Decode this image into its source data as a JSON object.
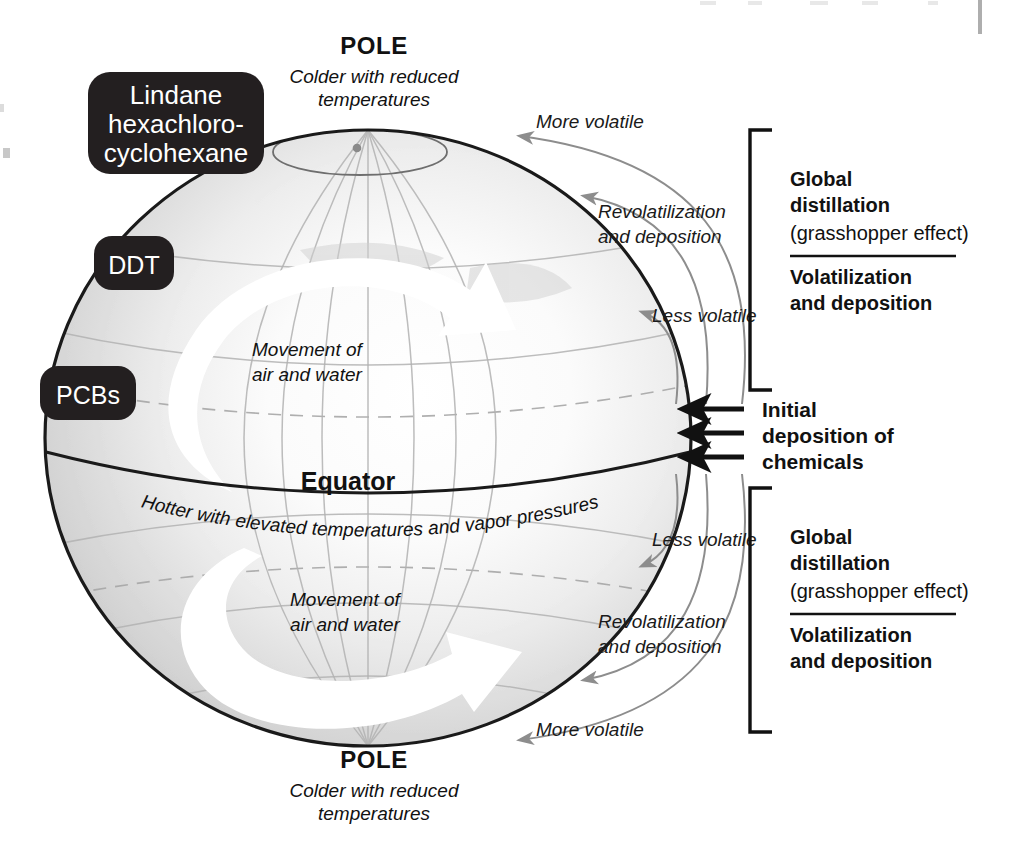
{
  "figure": {
    "accent_black": "#231f20",
    "globe_outline": "#1a1a1a",
    "globe_gray": "#d6d6d6",
    "grid_gray": "#a8a8a8",
    "arrow_gray": "#8d8d8d"
  },
  "poles": {
    "top": {
      "title": "POLE",
      "subtitle_line1": "Colder with reduced",
      "subtitle_line2": "temperatures"
    },
    "bottom": {
      "title": "POLE",
      "subtitle_line1": "Colder with reduced",
      "subtitle_line2": "temperatures"
    }
  },
  "equator": {
    "label": "Equator",
    "caption": "Hotter with elevated temperatures and vapor pressures"
  },
  "movement_labels": [
    {
      "line1": "Movement of",
      "line2": "air and water"
    },
    {
      "line1": "Movement of",
      "line2": "air and water"
    }
  ],
  "chemical_chips": [
    {
      "id": "lindane",
      "line1": "Lindane",
      "line2": "hexachloro-",
      "line3": "cyclohexane"
    },
    {
      "id": "ddt",
      "line1": "DDT"
    },
    {
      "id": "pcbs",
      "line1": "PCBs"
    }
  ],
  "northern_curves": [
    {
      "id": "n-more-volatile",
      "label": "More volatile"
    },
    {
      "id": "n-revolatilization",
      "line1": "Revolatilization",
      "line2": "and deposition"
    },
    {
      "id": "n-less-volatile",
      "label": "Less volatile"
    }
  ],
  "southern_curves": [
    {
      "id": "s-less-volatile",
      "label": "Less volatile"
    },
    {
      "id": "s-revolatilization",
      "line1": "Revolatilization",
      "line2": "and deposition"
    },
    {
      "id": "s-more-volatile",
      "label": "More volatile"
    }
  ],
  "brackets": [
    {
      "id": "north-bracket",
      "heading_line1": "Global",
      "heading_line2": "distillation",
      "heading_line3": "(grasshopper effect)",
      "sub_line1": "Volatilization",
      "sub_line2": "and deposition"
    },
    {
      "id": "south-bracket",
      "heading_line1": "Global",
      "heading_line2": "distillation",
      "heading_line3": "(grasshopper effect)",
      "sub_line1": "Volatilization",
      "sub_line2": "and deposition"
    }
  ],
  "initial_deposition": {
    "line1": "Initial",
    "line2": "deposition of",
    "line3": "chemicals",
    "arrow_count": 3
  }
}
